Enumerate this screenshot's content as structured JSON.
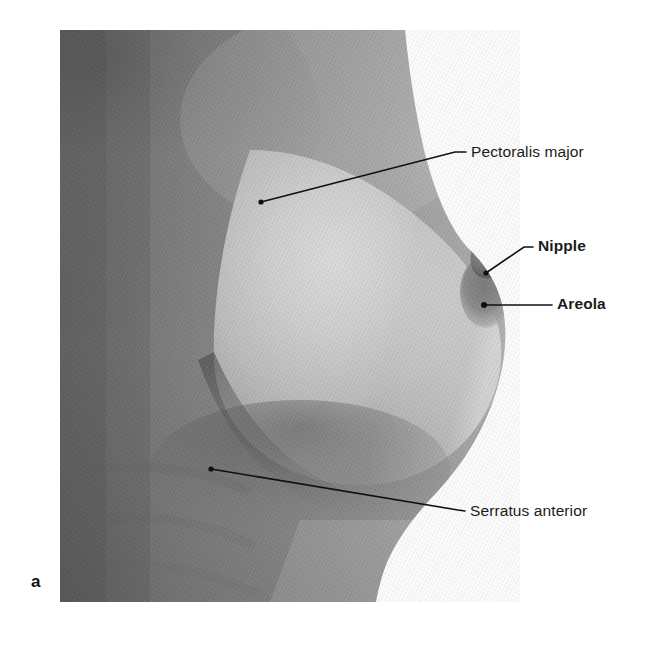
{
  "figure": {
    "panel_letter": "a",
    "type": "anatomical-photograph",
    "background_color": "#ffffff",
    "leader_line_color": "#101010",
    "label_text_color": "#1b1b1b",
    "photo_frame": {
      "left": 60,
      "top": 30,
      "right": 520,
      "bottom": 602
    }
  },
  "labels": [
    {
      "id": "pectoralis-major",
      "text": "Pectoralis major",
      "bold": false,
      "text_x": 471,
      "text_y": 144,
      "dot_x": 261,
      "dot_y": 202,
      "elbow_x": 455,
      "elbow_y": 152,
      "end_x": 466,
      "end_y": 152
    },
    {
      "id": "nipple",
      "text": "Nipple",
      "bold": true,
      "text_x": 538,
      "text_y": 238,
      "dot_x": 486,
      "dot_y": 273,
      "elbow_x": 524,
      "elbow_y": 247,
      "end_x": 533,
      "end_y": 247
    },
    {
      "id": "areola",
      "text": "Areola",
      "bold": true,
      "text_x": 557,
      "text_y": 296,
      "dot_x": 484,
      "dot_y": 305,
      "elbow_x": 552,
      "elbow_y": 305,
      "end_x": 552,
      "end_y": 305
    },
    {
      "id": "serratus-anterior",
      "text": "Serratus anterior",
      "bold": false,
      "text_x": 470,
      "text_y": 503,
      "dot_x": 211,
      "dot_y": 469,
      "elbow_x": 458,
      "elbow_y": 510,
      "end_x": 465,
      "end_y": 511
    }
  ]
}
